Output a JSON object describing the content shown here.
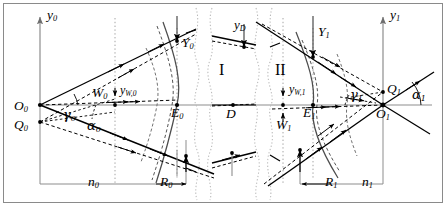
{
  "figure": {
    "kind": "optical-ray-diagram",
    "background_color": "#ffffff",
    "line_color": "#000000",
    "axis_color": "#808080",
    "dotted_color": "#b0b0b0"
  },
  "labels": {
    "y_axis_left": "y",
    "y_axis_left_sub": "0",
    "y_axis_right": "y",
    "y_axis_right_sub": "1",
    "y_D": "y",
    "y_D_sub": "D",
    "y_W0": "y",
    "y_W0_sub": "W,0",
    "y_W1": "y",
    "y_W1_sub": "W,1",
    "origin_left": "O",
    "origin_left_sub": "0",
    "origin_right": "O",
    "origin_right_sub": "1",
    "Q_left": "Q",
    "Q_left_sub": "0",
    "Q_right": "Q",
    "Q_right_sub": "1",
    "W_left": "W",
    "W_left_sub": "0",
    "W_right": "W",
    "W_right_sub": "1",
    "E_left": "E",
    "E_left_sub": "0",
    "E_right": "E",
    "E_right_sub": "1",
    "Y_left": "Y",
    "Y_left_sub": "0",
    "Y_right": "Y",
    "Y_right_sub": "1",
    "R_left": "R",
    "R_left_sub": "0",
    "R_right": "R",
    "R_right_sub": "1",
    "n_left": "n",
    "n_left_sub": "0",
    "n_right": "n",
    "n_right_sub": "1",
    "gamma_left": "γ",
    "gamma_left_sub": "0",
    "gamma_right": "γ",
    "gamma_right_sub": "1",
    "alpha_left": "α",
    "alpha_left_sub": "0",
    "alpha_right": "α",
    "alpha_right_sub": "1",
    "D": "D",
    "region_one": "I",
    "region_two": "II"
  }
}
